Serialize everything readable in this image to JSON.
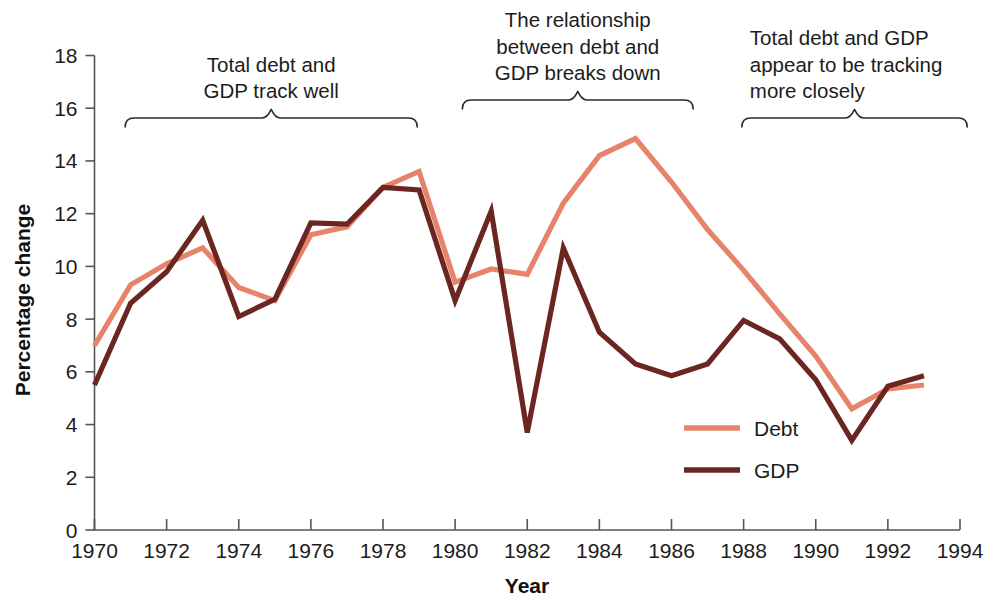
{
  "chart_data": {
    "type": "line",
    "title": "",
    "xlabel": "Year",
    "ylabel": "Percentage change",
    "xlim": [
      1970,
      1994
    ],
    "ylim": [
      0,
      18
    ],
    "xticks": [
      1970,
      1972,
      1974,
      1976,
      1978,
      1980,
      1982,
      1984,
      1986,
      1988,
      1990,
      1992,
      1994
    ],
    "xtick_labels": [
      "1970",
      "1972",
      "1974",
      "1976",
      "1978",
      "1980",
      "1982",
      "1984",
      "1986",
      "1988",
      "1990",
      "1992",
      "1994"
    ],
    "yticks": [
      0,
      2,
      4,
      6,
      8,
      10,
      12,
      14,
      16,
      18
    ],
    "ytick_labels": [
      "0",
      "2",
      "4",
      "6",
      "8",
      "10",
      "12",
      "14",
      "16",
      "18"
    ],
    "grid": false,
    "legend_position": "inside-lower-right",
    "x": [
      1970,
      1971,
      1972,
      1973,
      1974,
      1975,
      1976,
      1977,
      1978,
      1979,
      1980,
      1981,
      1982,
      1983,
      1984,
      1985,
      1986,
      1987,
      1988,
      1989,
      1990,
      1991,
      1992,
      1993
    ],
    "series": [
      {
        "name": "Debt",
        "color": "#E8836B",
        "values": [
          7.0,
          9.3,
          10.1,
          10.7,
          9.2,
          8.7,
          11.2,
          11.5,
          13.0,
          13.6,
          9.4,
          9.9,
          9.7,
          12.4,
          14.2,
          14.85,
          13.2,
          11.4,
          9.85,
          8.2,
          6.6,
          4.6,
          5.35,
          5.5
        ]
      },
      {
        "name": "GDP",
        "color": "#6B2622",
        "values": [
          5.5,
          8.6,
          9.8,
          11.75,
          8.1,
          8.75,
          11.65,
          11.6,
          13.0,
          12.9,
          8.7,
          12.1,
          3.7,
          10.7,
          7.5,
          6.3,
          5.85,
          6.3,
          7.95,
          7.25,
          5.7,
          3.4,
          5.45,
          5.85
        ]
      }
    ]
  },
  "annotations": [
    {
      "id": "annotation-left",
      "lines": [
        "Total debt and",
        "GDP track well"
      ],
      "brace_start_year": 1970.85,
      "brace_end_year": 1978.95
    },
    {
      "id": "annotation-middle",
      "lines": [
        "The relationship",
        "between debt and",
        "GDP breaks down"
      ],
      "brace_start_year": 1980.2,
      "brace_end_year": 1986.6
    },
    {
      "id": "annotation-right",
      "lines": [
        "Total debt and GDP",
        "appear to be tracking",
        "more closely"
      ],
      "brace_start_year": 1987.95,
      "brace_end_year": 1994.2
    }
  ],
  "legend": {
    "items": [
      {
        "label": "Debt",
        "color": "#E8836B"
      },
      {
        "label": "GDP",
        "color": "#6B2622"
      }
    ]
  },
  "colors": {
    "debt": "#E8836B",
    "gdp": "#6B2622",
    "axis": "#555555",
    "text": "#1c1c1c",
    "background": "#ffffff"
  }
}
